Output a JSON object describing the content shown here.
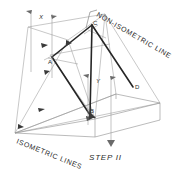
{
  "figure": {
    "title_label": "STEP II",
    "annotations": {
      "non_isometric": "NON-ISOMETRIC LINE",
      "isometric": "ISOMETRIC LINES"
    },
    "dimensions": [
      {
        "name": "x-dimension",
        "label": "X"
      },
      {
        "name": "y-dimension",
        "label": "Y"
      }
    ],
    "points": [
      {
        "id": "A",
        "label": "A"
      },
      {
        "id": "B",
        "label": "B"
      },
      {
        "id": "C",
        "label": "C"
      },
      {
        "id": "D",
        "label": "D"
      }
    ],
    "colors": {
      "background": "#ffffff",
      "construction_line": "#8d8d8d",
      "heavy_line": "#262626",
      "text": "#2b2b2b"
    }
  }
}
